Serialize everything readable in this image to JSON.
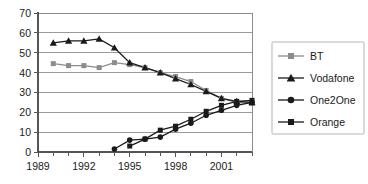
{
  "chart_data": {
    "type": "line",
    "title": "",
    "xlabel": "",
    "ylabel": "",
    "xlim": [
      1989,
      2003
    ],
    "ylim": [
      0,
      70
    ],
    "ytick_step": 10,
    "yticks": [
      0,
      10,
      20,
      30,
      40,
      50,
      60,
      70
    ],
    "xticks_major": [
      1989,
      1992,
      1995,
      1998,
      2001
    ],
    "xticks_minor_step": 1,
    "grid": true,
    "grid_axis": "y",
    "legend_position": "right-outside",
    "series": [
      {
        "name": "BT",
        "color": "#8c8c8c",
        "marker": "square",
        "x": [
          1990,
          1991,
          1992,
          1993,
          1994,
          1995,
          1996,
          1997,
          1998,
          1999,
          2000,
          2001,
          2002,
          2003
        ],
        "values": [
          44.5,
          43.5,
          43.5,
          42.5,
          45,
          44,
          42.5,
          40,
          38,
          35.5,
          31,
          27,
          25,
          24.5
        ]
      },
      {
        "name": "Vodafone",
        "color": "#1a1a1a",
        "marker": "triangle",
        "x": [
          1990,
          1991,
          1992,
          1993,
          1994,
          1995,
          1996,
          1997,
          1998,
          1999,
          2000,
          2001,
          2002,
          2003
        ],
        "values": [
          55,
          56,
          56,
          57,
          52.5,
          45,
          42.5,
          40,
          37,
          34,
          30.5,
          27,
          25.5,
          25
        ]
      },
      {
        "name": "One2One",
        "color": "#1a1a1a",
        "marker": "circle",
        "x": [
          1994,
          1995,
          1996,
          1997,
          1998,
          1999,
          2000,
          2001,
          2002,
          2003
        ],
        "values": [
          1.5,
          6,
          6.5,
          7.5,
          11.5,
          14.5,
          18.5,
          21,
          23.5,
          25
        ]
      },
      {
        "name": "Orange",
        "color": "#1a1a1a",
        "marker": "square",
        "x": [
          1995,
          1996,
          1997,
          1998,
          1999,
          2000,
          2001,
          2002,
          2003
        ],
        "values": [
          3,
          6.5,
          11,
          13,
          16.5,
          20.5,
          23.5,
          25.5,
          26
        ]
      }
    ],
    "legend_entries": [
      {
        "label": "BT",
        "color": "#8c8c8c",
        "marker": "square"
      },
      {
        "label": "Vodafone",
        "color": "#1a1a1a",
        "marker": "triangle"
      },
      {
        "label": "One2One",
        "color": "#1a1a1a",
        "marker": "circle"
      },
      {
        "label": "Orange",
        "color": "#1a1a1a",
        "marker": "square"
      }
    ]
  }
}
